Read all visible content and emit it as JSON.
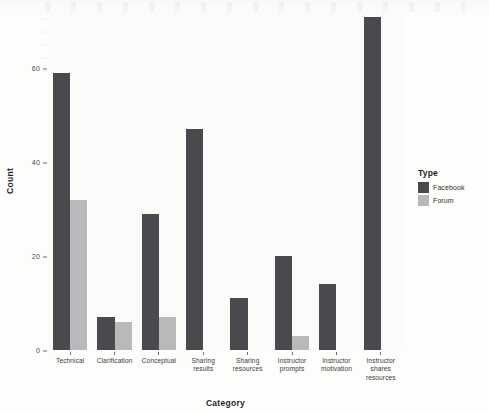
{
  "chart_data": {
    "type": "bar",
    "title": "",
    "xlabel": "Category",
    "ylabel": "Count",
    "categories": [
      "Technical",
      "Clarification",
      "Conceptual",
      "Sharing results",
      "Sharing resources",
      "Instructor prompts",
      "Instructor motivation",
      "Instructor shares resources"
    ],
    "category_lines": [
      [
        "Technical"
      ],
      [
        "Clarification"
      ],
      [
        "Conceptual"
      ],
      [
        "Sharing",
        "results"
      ],
      [
        "Sharing",
        "resources"
      ],
      [
        "Instructor",
        "prompts"
      ],
      [
        "Instructor",
        "motivation"
      ],
      [
        "Instructor",
        "shares",
        "resources"
      ]
    ],
    "series": [
      {
        "name": "Facebook",
        "color": "#4a4a4e",
        "values": [
          59,
          7,
          29,
          47,
          11,
          20,
          14,
          71
        ]
      },
      {
        "name": "Forum",
        "color": "#b9b9bb",
        "values": [
          32,
          6,
          7,
          0,
          0,
          3,
          0,
          0
        ]
      }
    ],
    "ylim": [
      0,
      72
    ],
    "yticks": [
      0,
      20,
      40,
      60
    ],
    "ytick_labels": [
      "0",
      "20",
      "40",
      "60"
    ],
    "grid": false,
    "legend_position": "right",
    "legend_title": "Type"
  },
  "axes": {
    "y_title": "Count",
    "x_title": "Category"
  },
  "legend": {
    "title": "Type",
    "entries": [
      {
        "label": "Facebook",
        "color": "#4a4a4e"
      },
      {
        "label": "Forum",
        "color": "#b9b9bb"
      }
    ]
  }
}
